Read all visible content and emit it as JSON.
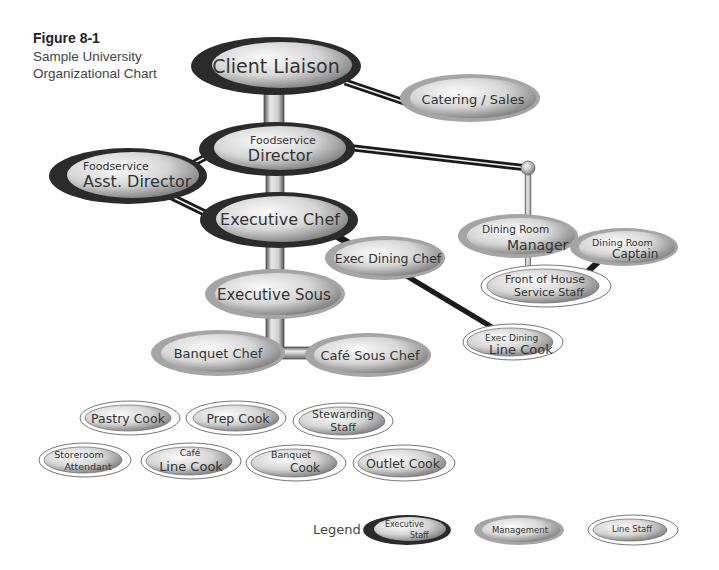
{
  "figure": {
    "number": "Figure 8-1",
    "caption_line1": "Sample University",
    "caption_line2": "Organizational Chart"
  },
  "colors": {
    "executive_rim": "#2b2b2b",
    "management_rim": "#9a9a9a",
    "line_staff_rim": "#ffffff",
    "connector_dark": "#1a1a1a",
    "node_fill_light": "#f4f4f4",
    "node_fill_dark": "#8a8a8a"
  },
  "nodes": [
    {
      "id": "client-liaison",
      "type": "executive",
      "line1": "",
      "line2": "Client Liaison"
    },
    {
      "id": "catering-sales",
      "type": "management",
      "line1": "",
      "line2": "Catering / Sales"
    },
    {
      "id": "foodservice-director",
      "type": "executive",
      "line1": "Foodservice",
      "line2": "Director"
    },
    {
      "id": "asst-director",
      "type": "executive",
      "line1": "Foodservice",
      "line2": "Asst. Director"
    },
    {
      "id": "executive-chef",
      "type": "executive",
      "line1": "",
      "line2": "Executive Chef"
    },
    {
      "id": "exec-dining-chef",
      "type": "management",
      "line1": "",
      "line2": "Exec Dining Chef"
    },
    {
      "id": "executive-sous",
      "type": "management",
      "line1": "",
      "line2": "Executive Sous"
    },
    {
      "id": "banquet-chef",
      "type": "management",
      "line1": "",
      "line2": "Banquet Chef"
    },
    {
      "id": "cafe-sous-chef",
      "type": "management",
      "line1": "",
      "line2": "Café Sous Chef"
    },
    {
      "id": "exec-dining-line-cook",
      "type": "line",
      "line1": "Exec Dining",
      "line2": "Line Cook"
    },
    {
      "id": "dining-room-manager",
      "type": "management",
      "line1": "Dining Room",
      "line2": "Manager"
    },
    {
      "id": "dining-room-captain",
      "type": "management",
      "line1": "Dining Room",
      "line2": "Captain"
    },
    {
      "id": "front-of-house",
      "type": "line",
      "line1": "Front of House",
      "line2": "Service Staff"
    },
    {
      "id": "pastry-cook",
      "type": "line",
      "line1": "",
      "line2": "Pastry Cook"
    },
    {
      "id": "prep-cook",
      "type": "line",
      "line1": "",
      "line2": "Prep Cook"
    },
    {
      "id": "stewarding-staff",
      "type": "line",
      "line1": "Stewarding",
      "line2": "Staff"
    },
    {
      "id": "storeroom-attendant",
      "type": "line",
      "line1": "Storeroom",
      "line2": "Attendant"
    },
    {
      "id": "cafe-line-cook",
      "type": "line",
      "line1": "Café",
      "line2": "Line Cook"
    },
    {
      "id": "banquet-cook",
      "type": "line",
      "line1": "Banquet",
      "line2": "Cook"
    },
    {
      "id": "outlet-cook",
      "type": "line",
      "line1": "",
      "line2": "Outlet Cook"
    }
  ],
  "legend": {
    "title": "Legend",
    "items": [
      {
        "type": "executive",
        "line1": "Executive",
        "line2": "Staff"
      },
      {
        "type": "management",
        "line1": "",
        "line2": "Management"
      },
      {
        "type": "line",
        "line1": "",
        "line2": "Line Staff"
      }
    ]
  }
}
